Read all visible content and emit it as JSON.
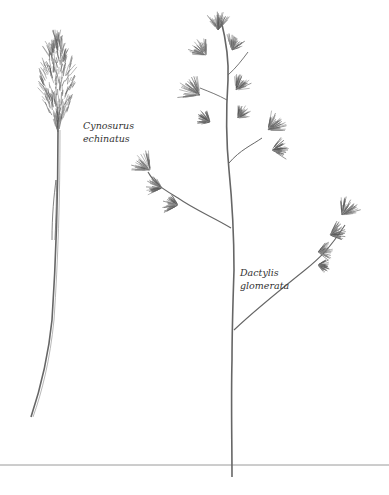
{
  "illustration": {
    "subject": "Botanical drawing of two grass species",
    "species": [
      {
        "id": "cynosurus",
        "genus": "Cynosurus",
        "epithet": "echinatus"
      },
      {
        "id": "dactylis",
        "genus": "Dactylis",
        "epithet": "glomerata"
      }
    ],
    "colors": {
      "ink": "#555555",
      "ink_dark": "#333333",
      "ground_line": "#999999",
      "background": "#ffffff"
    }
  }
}
